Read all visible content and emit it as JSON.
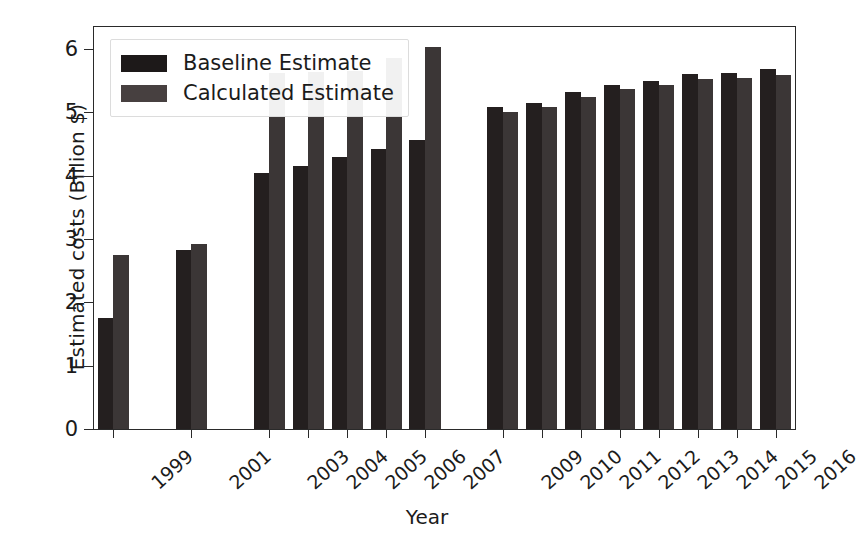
{
  "chart_data": {
    "type": "bar",
    "title": "",
    "xlabel": "Year",
    "ylabel": "Estimated costs (Billion $)",
    "categories": [
      "1999",
      "2001",
      "2003",
      "2004",
      "2005",
      "2006",
      "2007",
      "2009",
      "2010",
      "2011",
      "2012",
      "2013",
      "2014",
      "2015",
      "2016"
    ],
    "series": [
      {
        "name": "Baseline Estimate",
        "color": "#241f1f",
        "values": [
          1.75,
          2.82,
          4.04,
          4.16,
          4.29,
          4.43,
          4.56,
          5.08,
          5.15,
          5.32,
          5.43,
          5.5,
          5.6,
          5.62,
          5.68
        ]
      },
      {
        "name": "Calculated Estimate",
        "color": "#3b3636",
        "values": [
          2.75,
          2.92,
          5.62,
          5.64,
          5.65,
          5.86,
          6.03,
          5.0,
          5.09,
          5.25,
          5.37,
          5.44,
          5.53,
          5.55,
          5.59
        ]
      }
    ],
    "ylim": [
      0,
      6.35
    ],
    "yticks": [
      0,
      1,
      2,
      3,
      4,
      5,
      6
    ],
    "ytick_labels": [
      "0",
      "1",
      "2",
      "3",
      "4",
      "5",
      "6"
    ],
    "grid": false,
    "legend_position": "upper left",
    "xtick_rotation": -42,
    "gap_years": [
      "2000",
      "2002",
      "2008"
    ],
    "slot_order": [
      "1999",
      "gap",
      "2001",
      "gap",
      "2003",
      "2004",
      "2005",
      "2006",
      "2007",
      "gap",
      "2009",
      "2010",
      "2011",
      "2012",
      "2013",
      "2014",
      "2015",
      "2016"
    ]
  }
}
